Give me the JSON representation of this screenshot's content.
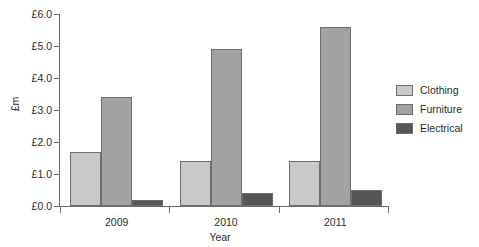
{
  "chart_data": {
    "type": "bar",
    "title": "",
    "xlabel": "Year",
    "ylabel": "£m",
    "categories": [
      "2009",
      "2010",
      "2011"
    ],
    "series": [
      {
        "name": "Clothing",
        "color": "#c9c9c9",
        "values": [
          1.7,
          1.4,
          1.4
        ]
      },
      {
        "name": "Furniture",
        "color": "#a2a2a2",
        "values": [
          3.4,
          4.9,
          5.6
        ]
      },
      {
        "name": "Electrical",
        "color": "#555555",
        "values": [
          0.2,
          0.4,
          0.5
        ]
      }
    ],
    "ylim": [
      0,
      6
    ],
    "ytick_values": [
      0,
      1,
      2,
      3,
      4,
      5,
      6
    ],
    "ytick_labels": [
      "£0.0",
      "£1.0",
      "£2.0",
      "£3.0",
      "£4.0",
      "£5.0",
      "£6.0"
    ],
    "grid": false,
    "legend_position": "right",
    "axis_color": "#6e6e6e",
    "bar_edge_color": "#6e6e6e",
    "background_color": "#ffffff"
  },
  "legend": {
    "items": [
      {
        "label": "Clothing",
        "color": "#c9c9c9"
      },
      {
        "label": "Furniture",
        "color": "#a2a2a2"
      },
      {
        "label": "Electrical",
        "color": "#555555"
      }
    ]
  }
}
